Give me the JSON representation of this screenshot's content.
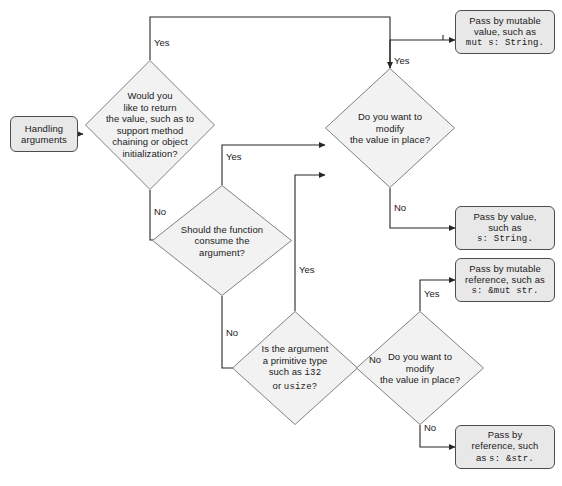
{
  "diagram": {
    "colors": {
      "node_fill": "#e8e8e8",
      "node_stroke": "#4d4d4d",
      "diamond_fill": "#f2f2f2",
      "diamond_stroke": "#808080",
      "wire": "#262626",
      "text": "#1a1a1a",
      "background": "#ffffff"
    }
  },
  "start": {
    "line1": "Handling",
    "line2": "arguments"
  },
  "decisions": {
    "return_value": {
      "l1": "Would you",
      "l2": "like to return",
      "l3": "the value, such as to",
      "l4": "support method",
      "l5": "chaining or object",
      "l6": "initialization?"
    },
    "consume_argument": {
      "l1": "Should the function",
      "l2": "consume the",
      "l3": "argument?"
    },
    "primitive_type": {
      "l1": "Is the argument",
      "l2": "a primitive type",
      "l3_pre": "such as ",
      "l3_code": "i32",
      "l4_pre": "or ",
      "l4_code": "usize?"
    },
    "modify_in_place_top": {
      "l1": "Do you want to",
      "l2": "modify",
      "l3": "the value in place?"
    },
    "modify_in_place_bottom": {
      "l1": "Do you want to",
      "l2": "modify",
      "l3": "the value in place?"
    }
  },
  "outcomes": {
    "pass_by_mutable_value": {
      "l1": "Pass by mutable",
      "l2": "value, such as",
      "code": "mut s: String."
    },
    "pass_by_value": {
      "l1": "Pass by value,",
      "l2": "such as",
      "code": "s: String."
    },
    "pass_by_mutable_reference": {
      "l1": "Pass by mutable",
      "l2": "reference, such as",
      "code": "s: &mut str."
    },
    "pass_by_reference": {
      "l1": "Pass by",
      "l2": "reference, such",
      "l3_pre": "as ",
      "l3_code": "s: &str."
    }
  },
  "edge_labels": {
    "return_yes": "Yes",
    "return_no": "No",
    "consume_yes": "Yes",
    "consume_no": "No",
    "primitive_yes": "Yes",
    "primitive_no": "No",
    "modify_top_yes": "Yes",
    "modify_top_no": "No",
    "modify_bottom_yes": "Yes",
    "modify_bottom_no": "No"
  }
}
